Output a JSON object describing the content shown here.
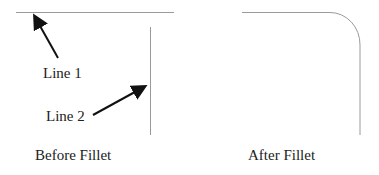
{
  "before": {
    "caption": "Before Fillet",
    "line1_label": "Line 1",
    "line2_label": "Line 2"
  },
  "after": {
    "caption": "After Fillet"
  },
  "colors": {
    "geometry": "#9a9a9a",
    "arrow": "#111111",
    "text": "#222222"
  }
}
